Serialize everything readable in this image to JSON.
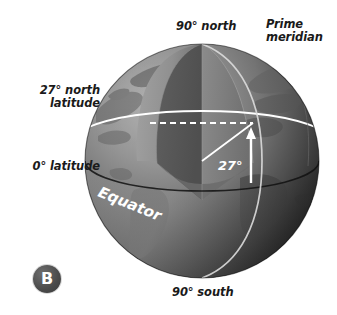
{
  "figure": {
    "panel_label": "B",
    "background_color": "#ffffff"
  },
  "labels": {
    "north_pole": "90° north",
    "prime_meridian": "Prime\nmeridian",
    "latitude_27_north": "27° north\nlatitude",
    "latitude_0": "0° latitude",
    "south_pole": "90° south",
    "equator": "Equator",
    "angle": "27°"
  },
  "colors": {
    "ocean_lit": "#8c8c8c",
    "ocean_shadow": "#2a2a2a",
    "land_lit": "#6a6a6a",
    "land_shadow": "#4a4a4a",
    "wedge_left_face": "#585858",
    "wedge_right_face": "#7a7a7a",
    "wedge_outer": "#9a9a9a",
    "guide_line": "#ffffff",
    "text": "#1a1a1a",
    "badge": "#4a4a4a"
  },
  "geometry": {
    "center_x": 202,
    "center_y": 161,
    "radius": 117,
    "angle_degrees": 27
  }
}
